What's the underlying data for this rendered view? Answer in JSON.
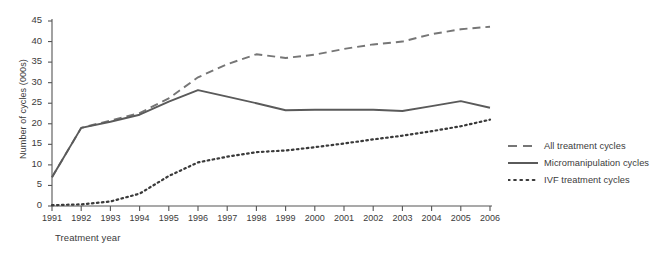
{
  "chart_data": {
    "type": "line",
    "title": "",
    "xlabel": "Treatment year",
    "ylabel": "Number of cycles (000s)",
    "x": [
      1991,
      1992,
      1993,
      1994,
      1995,
      1996,
      1997,
      1998,
      1999,
      2000,
      2001,
      2002,
      2003,
      2004,
      2005,
      2006
    ],
    "xtick_labels": [
      "1991",
      "1992",
      "1993",
      "1994",
      "1995",
      "1996",
      "1997",
      "1998",
      "1999",
      "2000",
      "2001",
      "2002",
      "2003",
      "2004",
      "2005",
      "2006"
    ],
    "ytick_labels": [
      "0",
      "5",
      "10",
      "15",
      "20",
      "25",
      "30",
      "35",
      "40",
      "45"
    ],
    "yticks": [
      0,
      5,
      10,
      15,
      20,
      25,
      30,
      35,
      40,
      45
    ],
    "ylim": [
      0,
      45
    ],
    "xlim": [
      1991,
      2006
    ],
    "grid": false,
    "legend_position": "right",
    "series": [
      {
        "name": "All treatment cycles",
        "style": "dashed",
        "color": "#767676",
        "values": [
          7.0,
          19.0,
          20.8,
          22.6,
          26.2,
          31.3,
          34.5,
          36.9,
          36.0,
          36.8,
          38.2,
          39.3,
          40.0,
          41.8,
          43.0,
          43.6
        ]
      },
      {
        "name": "Micromanipulation cycles",
        "style": "solid",
        "color": "#5a5a5a",
        "values": [
          7.0,
          19.0,
          20.5,
          22.2,
          25.4,
          28.2,
          26.6,
          25.0,
          23.3,
          23.4,
          23.4,
          23.4,
          23.1,
          24.3,
          25.5,
          23.9
        ]
      },
      {
        "name": "IVF treatment cycles",
        "style": "dotted",
        "color": "#3a3a3a",
        "values": [
          0.2,
          0.4,
          1.1,
          3.0,
          7.3,
          10.6,
          12.0,
          13.1,
          13.5,
          14.3,
          15.2,
          16.2,
          17.1,
          18.2,
          19.4,
          21.0
        ]
      }
    ]
  },
  "legend": {
    "items": [
      {
        "label": "All treatment cycles",
        "style": "dashed",
        "color": "#767676"
      },
      {
        "label": "Micromanipulation cycles",
        "style": "solid",
        "color": "#5a5a5a"
      },
      {
        "label": "IVF treatment cycles",
        "style": "dotted",
        "color": "#3a3a3a"
      }
    ]
  },
  "axes": {
    "y_title": "Number of cycles (000s)",
    "x_title": "Treatment year"
  }
}
